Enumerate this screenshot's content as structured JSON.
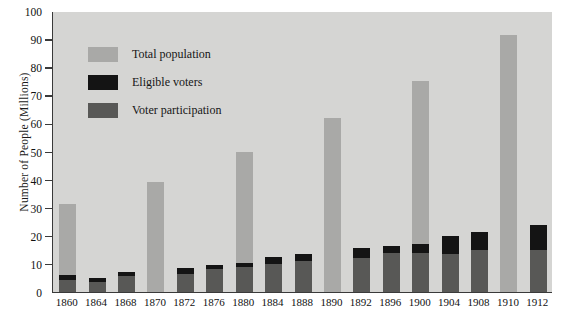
{
  "chart_data": {
    "type": "bar",
    "title": "",
    "subtitle": "",
    "xlabel": "",
    "ylabel": "Number of People (Millions)",
    "ylim": [
      0,
      100
    ],
    "ytick_step": 10,
    "yticks": [
      0,
      10,
      20,
      30,
      40,
      50,
      60,
      70,
      80,
      90,
      100
    ],
    "grid": false,
    "legend_position": "upper-left-inside",
    "stacking": "overlay",
    "categories": [
      "1860",
      "1864",
      "1868",
      "1870",
      "1872",
      "1876",
      "1880",
      "1884",
      "1888",
      "1890",
      "1892",
      "1896",
      "1900",
      "1904",
      "1908",
      "1910",
      "1912"
    ],
    "series": [
      {
        "name": "Total population",
        "color": "#a9a9a7",
        "values": [
          31.5,
          null,
          null,
          39.0,
          null,
          null,
          50.0,
          null,
          null,
          62.0,
          null,
          null,
          75.0,
          null,
          null,
          91.5,
          null
        ]
      },
      {
        "name": "Eligible voters",
        "color": "#141414",
        "values": [
          6.0,
          5.0,
          7.0,
          null,
          8.5,
          9.5,
          10.5,
          12.5,
          13.5,
          null,
          15.5,
          16.5,
          17.0,
          20.0,
          21.5,
          null,
          24.0
        ]
      },
      {
        "name": "Voter participation",
        "color": "#585856",
        "values": [
          4.2,
          3.5,
          5.8,
          null,
          6.5,
          8.2,
          9.0,
          10.0,
          11.2,
          null,
          12.0,
          13.8,
          14.0,
          13.5,
          15.0,
          null,
          15.0
        ]
      }
    ]
  },
  "legend": {
    "items": [
      {
        "label": "Total population",
        "color": "#a9a9a7"
      },
      {
        "label": "Eligible voters",
        "color": "#141414"
      },
      {
        "label": "Voter participation",
        "color": "#585856"
      }
    ]
  },
  "axes": {
    "y_title": "Number of People (Millions)"
  },
  "colors": {
    "plot_background": "#d5d5d3",
    "page_background": "#ffffff",
    "axis_line": "#3a3a3a",
    "text": "#111111"
  }
}
